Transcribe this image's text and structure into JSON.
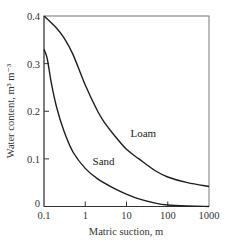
{
  "chart_data": {
    "type": "line",
    "title": "",
    "xlabel": "Matric suction, m",
    "ylabel": "Water content, m³ m⁻³",
    "xscale": "log",
    "xlim": [
      0.1,
      1000
    ],
    "ylim": [
      0,
      0.4
    ],
    "x_ticks": [
      "0.1",
      "1",
      "10",
      "100",
      "1000"
    ],
    "y_ticks": [
      "0",
      "0.1",
      "0.2",
      "0.3",
      "0.4"
    ],
    "grid": false,
    "legend": "inline labels",
    "series": [
      {
        "name": "Loam",
        "x": [
          0.1,
          0.2,
          0.3,
          0.5,
          1,
          2,
          3,
          5,
          10,
          20,
          50,
          100,
          300,
          1000
        ],
        "values": [
          0.4,
          0.375,
          0.355,
          0.32,
          0.255,
          0.2,
          0.175,
          0.15,
          0.12,
          0.1,
          0.075,
          0.062,
          0.05,
          0.042
        ]
      },
      {
        "name": "Sand",
        "x": [
          0.1,
          0.12,
          0.15,
          0.2,
          0.3,
          0.5,
          1,
          2,
          5,
          10,
          20,
          50,
          100,
          300,
          1000
        ],
        "values": [
          0.33,
          0.31,
          0.26,
          0.21,
          0.16,
          0.115,
          0.08,
          0.058,
          0.038,
          0.026,
          0.016,
          0.007,
          0.003,
          0.001,
          0.0
        ]
      }
    ],
    "annotations": [
      {
        "text": "Loam",
        "x": 10,
        "y": 0.155
      },
      {
        "text": "Sand",
        "x": 1.2,
        "y": 0.095
      }
    ]
  }
}
